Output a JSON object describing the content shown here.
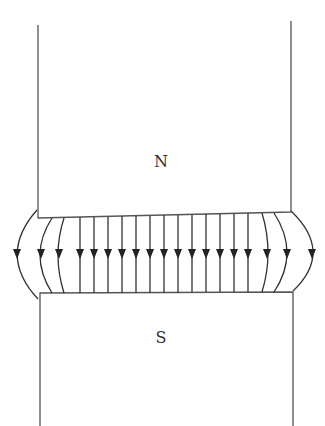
{
  "diagram": {
    "type": "magnetic-field-between-poles",
    "poles": {
      "north": {
        "label": "N",
        "label_x": 161,
        "label_y": 167
      },
      "south": {
        "label": "S",
        "label_y": 343,
        "label_x": 161
      }
    },
    "field_direction": "down",
    "field_line_count": 19,
    "colors": {
      "lines": "#333333",
      "edges": "#555555",
      "background": "#ffffff"
    }
  }
}
